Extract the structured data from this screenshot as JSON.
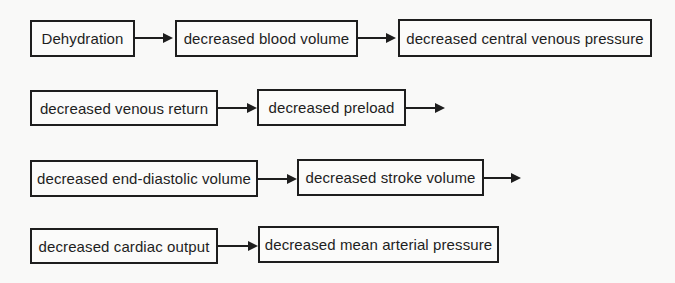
{
  "colors": {
    "bg": "#f9f9f8",
    "line": "#1e1e1e",
    "text": "#1e1e1e",
    "box-bg": "#fbfbfa"
  },
  "flowchart": {
    "rows": [
      {
        "boxes": [
          {
            "label": "Dehydration"
          },
          {
            "label": "decreased blood volume"
          },
          {
            "label": "decreased central venous pressure"
          }
        ],
        "trailing_arrow": false
      },
      {
        "boxes": [
          {
            "label": "decreased venous return"
          },
          {
            "label": "decreased preload"
          }
        ],
        "trailing_arrow": true
      },
      {
        "boxes": [
          {
            "label": "decreased end-diastolic volume"
          },
          {
            "label": "decreased stroke volume"
          }
        ],
        "trailing_arrow": true
      },
      {
        "boxes": [
          {
            "label": "decreased cardiac output"
          },
          {
            "label": "decreased mean arterial pressure"
          }
        ],
        "trailing_arrow": false
      }
    ]
  }
}
